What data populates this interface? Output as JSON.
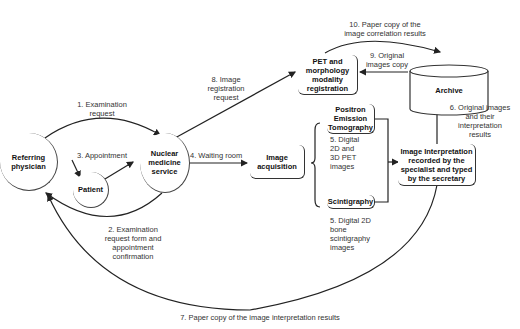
{
  "nodes": {
    "referring_physician": "Referring\nphysician",
    "patient": "Patient",
    "nuclear_medicine": "Nuclear\nmedicine\nservice",
    "image_acquisition": "Image\nacquisition",
    "pet_registration": "PET and\nmorphology\nmodality\nregistration",
    "archive": "Archive",
    "pet": "Positron\nEmission\nTomography",
    "scintigraphy": "Scintigraphy",
    "interpretation": "Image Interpretation\nrecorded by the\nspecialist and typed\nby the secretary"
  },
  "edges": {
    "e1": "1. Examination\nrequest",
    "e2": "2. Examination\nrequest form and\nappointment\nconfirmation",
    "e3": "3. Appointment",
    "e4": "4. Waiting room",
    "e5a": "5. Digital\n2D and\n3D PET\nimages",
    "e5b": "5. Digital 2D\nbone\nscintigraphy\nimages",
    "e6": "6. Original images\nand their\ninterpretation\nresults",
    "e7": "7. Paper copy of the image interpretation results",
    "e8": "8. Image\nregistration\nrequest",
    "e9": "9. Original\nimages copy",
    "e10": "10. Paper copy of the\nimage correlation results"
  },
  "colors": {
    "line": "#222222",
    "text": "#333333",
    "background": "#ffffff"
  }
}
